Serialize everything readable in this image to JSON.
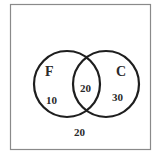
{
  "diagram": {
    "type": "venn",
    "universe": {
      "outside_value": "20"
    },
    "sets": [
      {
        "label": "F",
        "only_value": "10"
      },
      {
        "label": "C",
        "only_value": "30"
      }
    ],
    "intersection_value": "20",
    "colors": {
      "frame": "#8a8a8a",
      "circle": "#1e1e1e",
      "text": "#2a2a2a"
    }
  }
}
